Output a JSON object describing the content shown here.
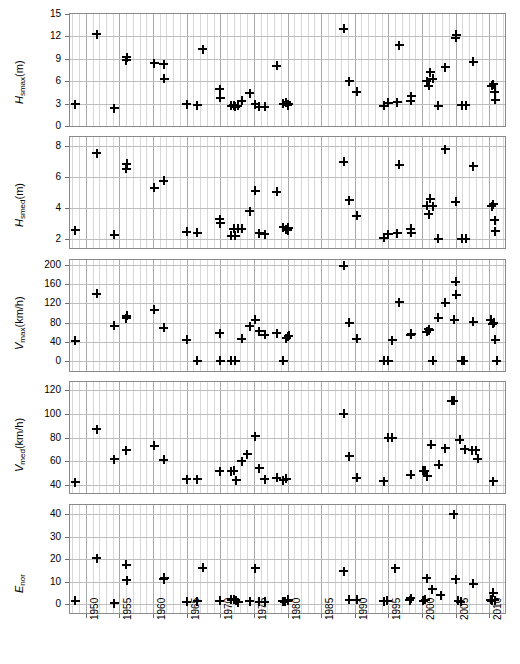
{
  "chart_data": {
    "type": "scatter",
    "title": "",
    "xlabel": "",
    "xlim": [
      1947.5,
      2012.5
    ],
    "xticks": [
      1950,
      1955,
      1960,
      1965,
      1970,
      1975,
      1980,
      1985,
      1990,
      1995,
      2000,
      2005,
      2010
    ],
    "xtick_labels": [
      "1950",
      "1955",
      "1960",
      "1965",
      "1970",
      "1975",
      "1980",
      "1985",
      "1990",
      "1995",
      "2000",
      "2005",
      "2010"
    ],
    "x_minor_step": 1,
    "grid": true,
    "legend": "none",
    "panels": [
      {
        "id": "hsmax",
        "ylabel": "H_smax (m)",
        "ylabel_symbol": "H",
        "ylabel_subscript": "smax",
        "ylabel_unit": "(m)",
        "ylim": [
          0,
          15
        ],
        "yticks": [
          0,
          3,
          6,
          9,
          12,
          15
        ],
        "ytick_labels": [
          "0",
          "3",
          "6",
          "9",
          "12",
          "15"
        ],
        "points": [
          {
            "x": 1948.4,
            "y": 2.9
          },
          {
            "x": 1951.6,
            "y": 12.3
          },
          {
            "x": 1954.2,
            "y": 2.4
          },
          {
            "x": 1956.0,
            "y": 8.8
          },
          {
            "x": 1956.1,
            "y": 9.2
          },
          {
            "x": 1960.2,
            "y": 8.4
          },
          {
            "x": 1961.6,
            "y": 8.3
          },
          {
            "x": 1961.7,
            "y": 6.3
          },
          {
            "x": 1965.0,
            "y": 2.9
          },
          {
            "x": 1966.6,
            "y": 2.8
          },
          {
            "x": 1967.4,
            "y": 10.3
          },
          {
            "x": 1969.9,
            "y": 4.9
          },
          {
            "x": 1970.0,
            "y": 3.8
          },
          {
            "x": 1971.6,
            "y": 2.7
          },
          {
            "x": 1972.0,
            "y": 2.8
          },
          {
            "x": 1972.2,
            "y": 2.6
          },
          {
            "x": 1972.6,
            "y": 2.7
          },
          {
            "x": 1973.2,
            "y": 3.4
          },
          {
            "x": 1974.4,
            "y": 4.4
          },
          {
            "x": 1975.2,
            "y": 2.9
          },
          {
            "x": 1975.8,
            "y": 2.6
          },
          {
            "x": 1976.6,
            "y": 2.6
          },
          {
            "x": 1978.4,
            "y": 8.1
          },
          {
            "x": 1979.4,
            "y": 3.0
          },
          {
            "x": 1979.8,
            "y": 3.2
          },
          {
            "x": 1980.0,
            "y": 2.8
          },
          {
            "x": 1980.1,
            "y": 2.9
          },
          {
            "x": 1988.4,
            "y": 13.0
          },
          {
            "x": 1989.2,
            "y": 6.0
          },
          {
            "x": 1990.3,
            "y": 4.6
          },
          {
            "x": 1994.3,
            "y": 2.7
          },
          {
            "x": 1995.0,
            "y": 3.1
          },
          {
            "x": 1996.3,
            "y": 3.2
          },
          {
            "x": 1996.6,
            "y": 10.8
          },
          {
            "x": 1998.3,
            "y": 3.4
          },
          {
            "x": 1998.4,
            "y": 4.0
          },
          {
            "x": 2000.7,
            "y": 6.0
          },
          {
            "x": 2001.0,
            "y": 5.4
          },
          {
            "x": 2001.2,
            "y": 7.2
          },
          {
            "x": 2001.6,
            "y": 6.3
          },
          {
            "x": 2002.4,
            "y": 2.7
          },
          {
            "x": 2003.5,
            "y": 7.9
          },
          {
            "x": 2005.0,
            "y": 11.8
          },
          {
            "x": 2005.1,
            "y": 12.2
          },
          {
            "x": 2005.9,
            "y": 2.8
          },
          {
            "x": 2006.5,
            "y": 2.8
          },
          {
            "x": 2007.6,
            "y": 8.6
          },
          {
            "x": 2010.4,
            "y": 5.4
          },
          {
            "x": 2010.6,
            "y": 5.6
          },
          {
            "x": 2010.8,
            "y": 4.6
          },
          {
            "x": 2010.9,
            "y": 3.5
          }
        ]
      },
      {
        "id": "hsmed",
        "ylabel": "H_smed (m)",
        "ylabel_symbol": "H",
        "ylabel_subscript": "smed",
        "ylabel_unit": "(m)",
        "ylim": [
          1.4,
          8.6
        ],
        "yticks": [
          2,
          4,
          6,
          8
        ],
        "ytick_labels": [
          "2",
          "4",
          "6",
          "8"
        ],
        "points": [
          {
            "x": 1948.4,
            "y": 2.55
          },
          {
            "x": 1951.6,
            "y": 7.55
          },
          {
            "x": 1954.2,
            "y": 2.25
          },
          {
            "x": 1956.0,
            "y": 6.55
          },
          {
            "x": 1956.1,
            "y": 6.85
          },
          {
            "x": 1960.2,
            "y": 5.3
          },
          {
            "x": 1961.6,
            "y": 5.75
          },
          {
            "x": 1965.0,
            "y": 2.45
          },
          {
            "x": 1966.6,
            "y": 2.4
          },
          {
            "x": 1969.9,
            "y": 3.25
          },
          {
            "x": 1970.0,
            "y": 3.0
          },
          {
            "x": 1971.6,
            "y": 2.2
          },
          {
            "x": 1972.0,
            "y": 2.65
          },
          {
            "x": 1972.2,
            "y": 2.2
          },
          {
            "x": 1972.6,
            "y": 2.65
          },
          {
            "x": 1973.2,
            "y": 2.65
          },
          {
            "x": 1974.4,
            "y": 3.8
          },
          {
            "x": 1975.2,
            "y": 5.1
          },
          {
            "x": 1975.8,
            "y": 2.35
          },
          {
            "x": 1976.6,
            "y": 2.3
          },
          {
            "x": 1978.4,
            "y": 5.05
          },
          {
            "x": 1979.4,
            "y": 2.75
          },
          {
            "x": 1979.8,
            "y": 2.6
          },
          {
            "x": 1980.0,
            "y": 2.55
          },
          {
            "x": 1980.1,
            "y": 2.7
          },
          {
            "x": 1988.4,
            "y": 7.0
          },
          {
            "x": 1989.2,
            "y": 4.5
          },
          {
            "x": 1990.3,
            "y": 3.5
          },
          {
            "x": 1994.3,
            "y": 2.05
          },
          {
            "x": 1995.0,
            "y": 2.3
          },
          {
            "x": 1996.3,
            "y": 2.35
          },
          {
            "x": 1996.6,
            "y": 6.8
          },
          {
            "x": 1998.3,
            "y": 2.65
          },
          {
            "x": 1998.4,
            "y": 2.4
          },
          {
            "x": 2000.7,
            "y": 4.15
          },
          {
            "x": 2001.0,
            "y": 3.6
          },
          {
            "x": 2001.2,
            "y": 4.6
          },
          {
            "x": 2001.6,
            "y": 4.1
          },
          {
            "x": 2002.4,
            "y": 2.0
          },
          {
            "x": 2003.5,
            "y": 7.8
          },
          {
            "x": 2005.0,
            "y": 4.4
          },
          {
            "x": 2005.9,
            "y": 2.0
          },
          {
            "x": 2006.5,
            "y": 2.0
          },
          {
            "x": 2007.6,
            "y": 6.7
          },
          {
            "x": 2010.4,
            "y": 4.1
          },
          {
            "x": 2010.6,
            "y": 4.25
          },
          {
            "x": 2010.8,
            "y": 3.2
          },
          {
            "x": 2010.9,
            "y": 2.5
          }
        ]
      },
      {
        "id": "vmax",
        "ylabel": "V_max (km/h)",
        "ylabel_symbol": "V",
        "ylabel_subscript": "max",
        "ylabel_unit": "(km/h)",
        "ylim": [
          -20,
          210
        ],
        "yticks": [
          0,
          40,
          80,
          120,
          160,
          200
        ],
        "ytick_labels": [
          "0",
          "40",
          "80",
          "120",
          "160",
          "200"
        ],
        "points": [
          {
            "x": 1948.4,
            "y": 43
          },
          {
            "x": 1951.6,
            "y": 140
          },
          {
            "x": 1954.2,
            "y": 74
          },
          {
            "x": 1956.0,
            "y": 89
          },
          {
            "x": 1956.1,
            "y": 95
          },
          {
            "x": 1960.2,
            "y": 107
          },
          {
            "x": 1961.6,
            "y": 70
          },
          {
            "x": 1965.0,
            "y": 45
          },
          {
            "x": 1966.6,
            "y": 1
          },
          {
            "x": 1969.9,
            "y": 58
          },
          {
            "x": 1970.0,
            "y": 1
          },
          {
            "x": 1971.6,
            "y": 1
          },
          {
            "x": 1972.2,
            "y": 1
          },
          {
            "x": 1973.2,
            "y": 47
          },
          {
            "x": 1974.4,
            "y": 73
          },
          {
            "x": 1975.2,
            "y": 86
          },
          {
            "x": 1975.8,
            "y": 62
          },
          {
            "x": 1976.6,
            "y": 55
          },
          {
            "x": 1978.4,
            "y": 58
          },
          {
            "x": 1979.4,
            "y": 1
          },
          {
            "x": 1979.8,
            "y": 48
          },
          {
            "x": 1980.1,
            "y": 52
          },
          {
            "x": 1980.2,
            "y": 53
          },
          {
            "x": 1988.4,
            "y": 198
          },
          {
            "x": 1989.2,
            "y": 80
          },
          {
            "x": 1990.3,
            "y": 47
          },
          {
            "x": 1994.3,
            "y": 1
          },
          {
            "x": 1995.0,
            "y": 1
          },
          {
            "x": 1995.6,
            "y": 44
          },
          {
            "x": 1996.6,
            "y": 122
          },
          {
            "x": 1998.3,
            "y": 55
          },
          {
            "x": 1998.4,
            "y": 57
          },
          {
            "x": 2000.7,
            "y": 61
          },
          {
            "x": 2001.0,
            "y": 66
          },
          {
            "x": 2001.1,
            "y": 64
          },
          {
            "x": 2001.6,
            "y": 1
          },
          {
            "x": 2002.4,
            "y": 90
          },
          {
            "x": 2003.5,
            "y": 121
          },
          {
            "x": 2004.8,
            "y": 86
          },
          {
            "x": 2005.0,
            "y": 165
          },
          {
            "x": 2005.1,
            "y": 138
          },
          {
            "x": 2005.9,
            "y": 1
          },
          {
            "x": 2006.2,
            "y": 1
          },
          {
            "x": 2007.6,
            "y": 82
          },
          {
            "x": 2010.2,
            "y": 86
          },
          {
            "x": 2010.5,
            "y": 78
          },
          {
            "x": 2010.7,
            "y": 80
          },
          {
            "x": 2010.9,
            "y": 45
          },
          {
            "x": 2011.1,
            "y": 1
          }
        ]
      },
      {
        "id": "vmed",
        "ylabel": "V_med (km/h)",
        "ylabel_symbol": "V",
        "ylabel_subscript": "med",
        "ylabel_unit": "(km/h)",
        "ylim": [
          33,
          127
        ],
        "yticks": [
          40,
          60,
          80,
          100,
          120
        ],
        "ytick_labels": [
          "40",
          "60",
          "80",
          "100",
          "120"
        ],
        "points": [
          {
            "x": 1948.4,
            "y": 42
          },
          {
            "x": 1951.6,
            "y": 87
          },
          {
            "x": 1954.2,
            "y": 61.5
          },
          {
            "x": 1956.0,
            "y": 69
          },
          {
            "x": 1960.2,
            "y": 73
          },
          {
            "x": 1961.6,
            "y": 61
          },
          {
            "x": 1965.0,
            "y": 44.5
          },
          {
            "x": 1966.6,
            "y": 44.5
          },
          {
            "x": 1969.9,
            "y": 51.5
          },
          {
            "x": 1971.6,
            "y": 51.5
          },
          {
            "x": 1972.0,
            "y": 52
          },
          {
            "x": 1972.4,
            "y": 44
          },
          {
            "x": 1973.2,
            "y": 60
          },
          {
            "x": 1974.0,
            "y": 66
          },
          {
            "x": 1975.2,
            "y": 81
          },
          {
            "x": 1975.8,
            "y": 54
          },
          {
            "x": 1976.6,
            "y": 44.5
          },
          {
            "x": 1978.4,
            "y": 46
          },
          {
            "x": 1979.4,
            "y": 44
          },
          {
            "x": 1979.8,
            "y": 45
          },
          {
            "x": 1988.4,
            "y": 100
          },
          {
            "x": 1989.2,
            "y": 64
          },
          {
            "x": 1990.3,
            "y": 46
          },
          {
            "x": 1994.3,
            "y": 43
          },
          {
            "x": 1995.0,
            "y": 80
          },
          {
            "x": 1995.6,
            "y": 80
          },
          {
            "x": 1998.3,
            "y": 48.5
          },
          {
            "x": 2000.2,
            "y": 52
          },
          {
            "x": 2000.4,
            "y": 52
          },
          {
            "x": 2000.8,
            "y": 47
          },
          {
            "x": 2001.4,
            "y": 74
          },
          {
            "x": 2002.5,
            "y": 57
          },
          {
            "x": 2003.5,
            "y": 71
          },
          {
            "x": 2004.4,
            "y": 111
          },
          {
            "x": 2004.7,
            "y": 111
          },
          {
            "x": 2005.6,
            "y": 78
          },
          {
            "x": 2006.4,
            "y": 70
          },
          {
            "x": 2007.5,
            "y": 69
          },
          {
            "x": 2008.0,
            "y": 69
          },
          {
            "x": 2008.3,
            "y": 62
          },
          {
            "x": 2010.6,
            "y": 43
          }
        ]
      },
      {
        "id": "enor",
        "ylabel": "E_nor",
        "ylabel_symbol": "E",
        "ylabel_subscript": "nor",
        "ylabel_unit": "",
        "ylim": [
          -4,
          44
        ],
        "yticks": [
          0,
          10,
          20,
          30,
          40
        ],
        "ytick_labels": [
          "0",
          "10",
          "20",
          "30",
          "40"
        ],
        "points": [
          {
            "x": 1948.4,
            "y": 1.5
          },
          {
            "x": 1951.6,
            "y": 20.4
          },
          {
            "x": 1954.2,
            "y": 0.4
          },
          {
            "x": 1956.0,
            "y": 17.4
          },
          {
            "x": 1956.1,
            "y": 10.6
          },
          {
            "x": 1961.6,
            "y": 11.0
          },
          {
            "x": 1961.7,
            "y": 11.6
          },
          {
            "x": 1965.0,
            "y": 1.0
          },
          {
            "x": 1966.6,
            "y": 1.3
          },
          {
            "x": 1967.4,
            "y": 16.2
          },
          {
            "x": 1969.9,
            "y": 1.5
          },
          {
            "x": 1971.6,
            "y": 1.9
          },
          {
            "x": 1972.0,
            "y": 2.2
          },
          {
            "x": 1972.3,
            "y": 1.6
          },
          {
            "x": 1972.7,
            "y": 0.8
          },
          {
            "x": 1974.4,
            "y": 1.2
          },
          {
            "x": 1975.2,
            "y": 15.8
          },
          {
            "x": 1975.8,
            "y": 1.0
          },
          {
            "x": 1976.6,
            "y": 1.0
          },
          {
            "x": 1979.3,
            "y": 1.3
          },
          {
            "x": 1979.6,
            "y": 1.1
          },
          {
            "x": 1980.0,
            "y": 1.5
          },
          {
            "x": 1980.1,
            "y": 2.0
          },
          {
            "x": 1988.4,
            "y": 14.5
          },
          {
            "x": 1989.2,
            "y": 2.0
          },
          {
            "x": 1990.3,
            "y": 1.8
          },
          {
            "x": 1994.3,
            "y": 1.2
          },
          {
            "x": 1994.8,
            "y": 1.4
          },
          {
            "x": 1996.0,
            "y": 16.0
          },
          {
            "x": 1998.2,
            "y": 1.7
          },
          {
            "x": 1998.3,
            "y": 2.5
          },
          {
            "x": 2000.2,
            "y": 1.4
          },
          {
            "x": 2000.5,
            "y": 2.0
          },
          {
            "x": 2000.7,
            "y": 11.5
          },
          {
            "x": 2001.5,
            "y": 6.5
          },
          {
            "x": 2002.8,
            "y": 4.0
          },
          {
            "x": 2004.7,
            "y": 39.8
          },
          {
            "x": 2005.0,
            "y": 11.0
          },
          {
            "x": 2005.4,
            "y": 1.5
          },
          {
            "x": 2005.8,
            "y": 1.1
          },
          {
            "x": 2007.6,
            "y": 9.0
          },
          {
            "x": 2010.2,
            "y": 2.0
          },
          {
            "x": 2010.4,
            "y": 1.5
          },
          {
            "x": 2010.6,
            "y": 5.0
          },
          {
            "x": 2010.8,
            "y": 1.6
          }
        ]
      }
    ]
  }
}
